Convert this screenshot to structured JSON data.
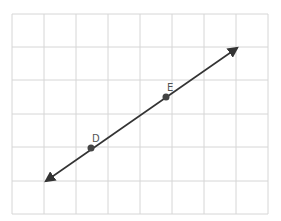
{
  "diagram": {
    "type": "coordinate-grid-line",
    "grid": {
      "columns": 8,
      "rows": 6,
      "color": "#d4d4d4"
    },
    "line": {
      "color": "#333333",
      "arrows": "both"
    },
    "points": [
      {
        "label": "D",
        "x": 91,
        "y": 148
      },
      {
        "label": "E",
        "x": 166,
        "y": 97
      }
    ]
  }
}
